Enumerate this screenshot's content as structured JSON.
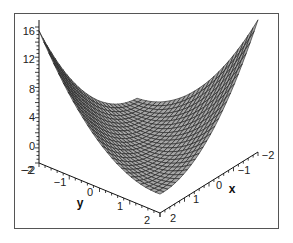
{
  "chart_data": {
    "type": "surface3d",
    "title": "",
    "xlabel": "x",
    "ylabel": "y",
    "zlabel": "",
    "x_ticks": [
      "-2",
      "-1",
      "0",
      "1",
      "2"
    ],
    "y_ticks": [
      "-2",
      "-1",
      "0",
      "1",
      "2"
    ],
    "z_ticks": [
      "-2",
      "0",
      "4",
      "8",
      "12",
      "16"
    ],
    "xlim": [
      -2,
      2
    ],
    "ylim": [
      -2,
      2
    ],
    "zlim": [
      -2,
      17
    ],
    "grid": false,
    "legend": null,
    "surface_color": "#a6a6a6",
    "mesh_color": "#1a1a1a",
    "mesh_resolution": 25,
    "corner_values": [
      {
        "x": -2,
        "y": -2,
        "z": 0
      },
      {
        "x": 2,
        "y": -2,
        "z": 16
      },
      {
        "x": -2,
        "y": 2,
        "z": 16
      },
      {
        "x": 2,
        "y": 2,
        "z": 0
      }
    ]
  },
  "frame": {
    "border_color": "#555555",
    "background": "#ffffff"
  }
}
